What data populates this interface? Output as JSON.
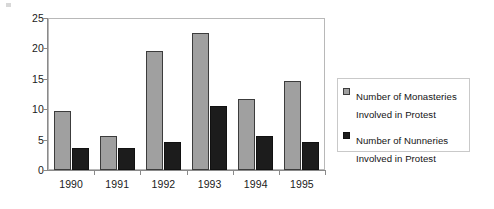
{
  "chart_data": {
    "type": "bar",
    "title": "",
    "xlabel": "",
    "ylabel": "",
    "categories": [
      "1990",
      "1991",
      "1992",
      "1993",
      "1994",
      "1995"
    ],
    "series": [
      {
        "name": "Number of Monasteries Involved in Protest",
        "color": "#a0a0a0",
        "values": [
          9.7,
          5.6,
          19.6,
          22.6,
          11.6,
          14.6
        ]
      },
      {
        "name": "Number of Nunneries Involved in Protest",
        "color": "#1c1c1c",
        "values": [
          3.7,
          3.7,
          4.6,
          10.6,
          5.6,
          4.6
        ]
      }
    ],
    "ylim": [
      0,
      25
    ],
    "yticks": [
      0,
      5,
      10,
      15,
      20,
      25
    ],
    "ytick_labels": [
      "0",
      "5",
      "10",
      "15",
      "20",
      "25"
    ],
    "grid": false,
    "legend_position": "right"
  },
  "legend": {
    "entries": [
      {
        "label": "Number of Monasteries\nInvolved in Protest",
        "swatch": "monasteries"
      },
      {
        "label": "Number of Nunneries\nInvolved in Protest",
        "swatch": "nunneries"
      }
    ]
  }
}
